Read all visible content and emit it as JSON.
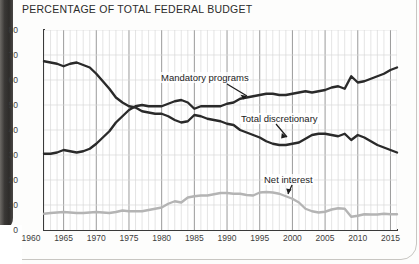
{
  "chart_title": "PERCENTAGE OF TOTAL FEDERAL BUDGET",
  "axis": {
    "y_ticks": [
      "0",
      "10",
      "20",
      "30",
      "40",
      "50",
      "60",
      "70",
      "80"
    ],
    "x_ticks": [
      "1960",
      "1965",
      "1970",
      "1975",
      "1980",
      "1985",
      "1990",
      "1995",
      "2000",
      "2005",
      "2010",
      "2015"
    ]
  },
  "labels": {
    "mandatory": "Mandatory programs",
    "discretionary": "Total discretionary",
    "net_interest": "Net interest"
  },
  "colors": {
    "dark_line": "#2a2a2a",
    "light_line": "#b4b4b4",
    "grid_minor": "#d9d9d9",
    "grid_major": "#8e8e8e",
    "axis": "#3a3a3a"
  },
  "chart_data": {
    "type": "line",
    "title": "PERCENTAGE OF TOTAL FEDERAL BUDGET",
    "xlabel": "",
    "ylabel": "",
    "xlim": [
      1962,
      2016
    ],
    "ylim": [
      0,
      80
    ],
    "grid": true,
    "legend": "inline-annotations",
    "x": [
      1962,
      1963,
      1964,
      1965,
      1966,
      1967,
      1968,
      1969,
      1970,
      1971,
      1972,
      1973,
      1974,
      1975,
      1976,
      1977,
      1978,
      1979,
      1980,
      1981,
      1982,
      1983,
      1984,
      1985,
      1986,
      1987,
      1988,
      1989,
      1990,
      1991,
      1992,
      1993,
      1994,
      1995,
      1996,
      1997,
      1998,
      1999,
      2000,
      2001,
      2002,
      2003,
      2004,
      2005,
      2006,
      2007,
      2008,
      2009,
      2010,
      2011,
      2012,
      2013,
      2014,
      2015,
      2016
    ],
    "series": [
      {
        "name": "Total discretionary",
        "color": "#2a2a2a",
        "values": [
          67.5,
          67.0,
          66.5,
          65.5,
          66.5,
          67.0,
          66.0,
          65.0,
          62.5,
          59.5,
          56.5,
          53.0,
          51.0,
          49.5,
          49.0,
          47.5,
          47.0,
          46.5,
          46.5,
          45.5,
          44.0,
          43.0,
          43.5,
          46.0,
          45.5,
          44.5,
          44.0,
          43.5,
          42.5,
          42.0,
          40.0,
          39.0,
          38.0,
          37.0,
          35.5,
          34.5,
          34.0,
          34.0,
          34.5,
          35.0,
          36.5,
          38.0,
          38.5,
          38.5,
          38.0,
          37.5,
          38.5,
          36.0,
          38.0,
          37.0,
          35.5,
          34.0,
          33.0,
          32.0,
          31.0
        ]
      },
      {
        "name": "Mandatory programs",
        "color": "#2a2a2a",
        "values": [
          30.5,
          30.5,
          31.0,
          32.0,
          31.5,
          31.0,
          31.5,
          32.5,
          34.5,
          37.0,
          39.5,
          43.0,
          45.5,
          48.0,
          49.5,
          50.0,
          49.5,
          49.5,
          49.5,
          50.5,
          51.5,
          52.0,
          51.0,
          48.5,
          49.5,
          49.5,
          49.5,
          49.5,
          50.5,
          51.0,
          52.5,
          53.0,
          53.5,
          54.0,
          54.5,
          54.5,
          54.0,
          54.0,
          54.5,
          55.0,
          55.5,
          55.0,
          55.5,
          56.0,
          57.0,
          57.5,
          56.5,
          61.5,
          59.0,
          59.5,
          60.5,
          61.5,
          62.5,
          64.0,
          65.0
        ]
      },
      {
        "name": "Net interest",
        "color": "#b4b4b4",
        "values": [
          6.5,
          6.8,
          7.0,
          7.2,
          7.0,
          6.8,
          6.8,
          7.0,
          7.2,
          7.0,
          6.8,
          7.2,
          7.8,
          7.5,
          7.5,
          7.5,
          8.0,
          8.5,
          9.0,
          10.5,
          11.5,
          11.0,
          13.0,
          13.5,
          13.8,
          13.8,
          14.3,
          14.8,
          14.8,
          14.5,
          14.5,
          14.0,
          13.8,
          15.0,
          15.2,
          15.0,
          14.5,
          13.5,
          12.5,
          11.0,
          8.5,
          7.5,
          7.0,
          7.3,
          8.2,
          8.7,
          8.5,
          5.3,
          5.7,
          6.3,
          6.2,
          6.2,
          6.5,
          6.3,
          6.3
        ]
      }
    ]
  }
}
